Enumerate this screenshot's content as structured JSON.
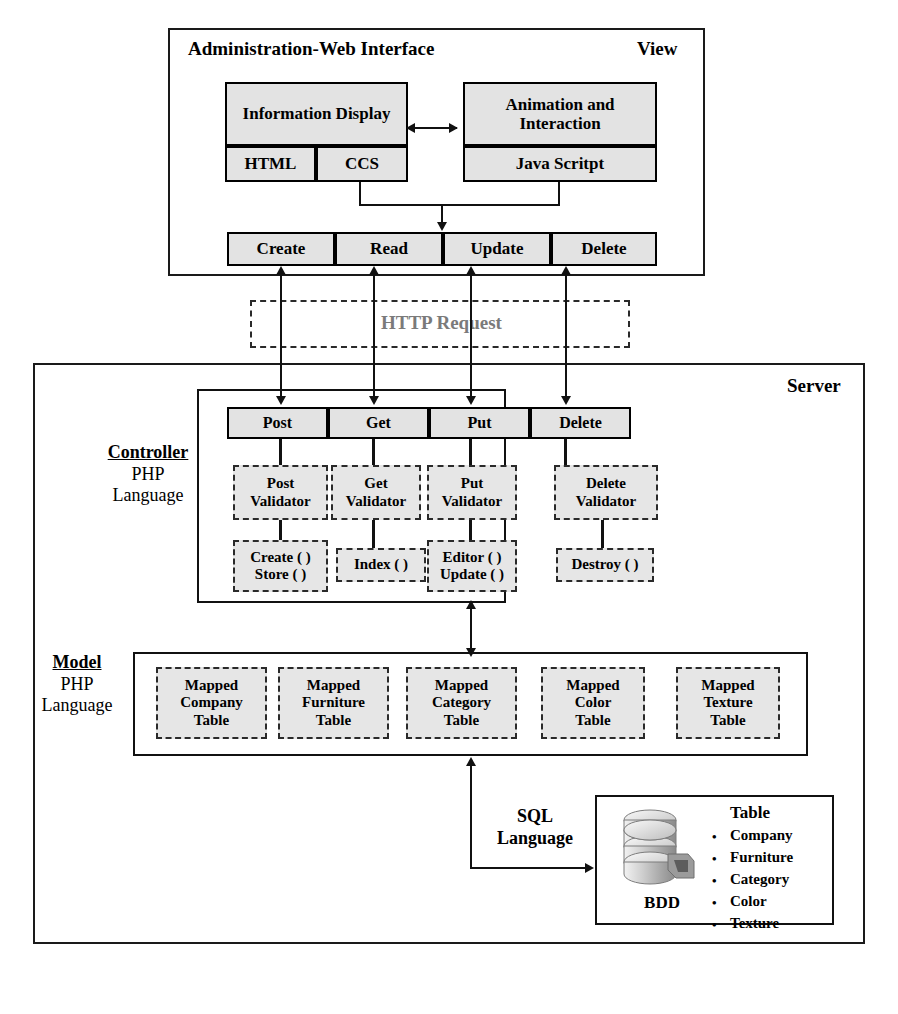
{
  "diagram": {
    "colors": {
      "node_fill": "#e3e3e3",
      "dashed_fill": "#e6e6e6",
      "stroke": "#111111",
      "http_text": "#7a7a7a"
    }
  },
  "view": {
    "heading": "Administration-Web Interface",
    "corner_label": "View",
    "information_display": {
      "title": "Information Display",
      "sub_left": "HTML",
      "sub_right": "CCS"
    },
    "animation": {
      "title": "Animation and Interaction",
      "sub": "Java Scritpt"
    },
    "crud": [
      "Create",
      "Read",
      "Update",
      "Delete"
    ]
  },
  "http": {
    "label": "HTTP Request"
  },
  "server": {
    "corner_label": "Server",
    "controller": {
      "label_title": "Controller",
      "label_sub_1": "PHP",
      "label_sub_2": "Language",
      "verbs": [
        "Post",
        "Get",
        "Put",
        "Delete"
      ],
      "validators": [
        "Post Validator",
        "Get Validator",
        "Put Validator",
        "Delete Validator"
      ],
      "methods": [
        {
          "lines": [
            "Create ( )",
            "Store ( )"
          ]
        },
        {
          "lines": [
            "Index ( )"
          ]
        },
        {
          "lines": [
            "Editor ( )",
            "Update ( )"
          ]
        },
        {
          "lines": [
            "Destroy ( )"
          ]
        }
      ]
    },
    "model": {
      "label_title": "Model",
      "label_sub_1": "PHP",
      "label_sub_2": "Language",
      "mapped_tables": [
        {
          "lines": [
            "Mapped",
            "Company",
            "Table"
          ]
        },
        {
          "lines": [
            "Mapped",
            "Furniture",
            "Table"
          ]
        },
        {
          "lines": [
            "Mapped",
            "Category",
            "Table"
          ]
        },
        {
          "lines": [
            "Mapped",
            "Color",
            "Table"
          ]
        },
        {
          "lines": [
            "Mapped",
            "Texture",
            "Table"
          ]
        }
      ]
    },
    "database": {
      "sql_label_1": "SQL",
      "sql_label_2": "Language",
      "caption": "BDD",
      "table_heading": "Table",
      "tables": [
        "Company",
        "Furniture",
        "Category",
        "Color",
        "Texture"
      ]
    }
  }
}
